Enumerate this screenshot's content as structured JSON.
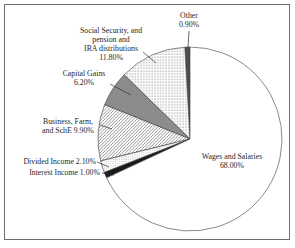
{
  "chart_data": {
    "type": "pie",
    "title": "",
    "categories": [
      "Other",
      "Social Security, and pension and IRA distributions",
      "Capital Gains",
      "Business, Farm, and SchE",
      "Divided Income",
      "Interest Income",
      "Wages and Salaries"
    ],
    "values": [
      0.9,
      11.8,
      6.2,
      9.9,
      2.1,
      1.0,
      68.0
    ],
    "unit": "percent",
    "start_angle_deg": 90,
    "direction": "counterclockwise",
    "legend_position": "labels-with-leader-lines",
    "grid": false,
    "slices": [
      {
        "name": "other",
        "category": "Other",
        "value": 0.9,
        "display": "Other\n0.90%",
        "fill": "dark-gray"
      },
      {
        "name": "social-security",
        "category": "Social Security, and pension and IRA distributions",
        "value": 11.8,
        "display": "Social Security, and\npension and\nIRA distributions\n11.80%",
        "fill": "dots"
      },
      {
        "name": "capital-gains",
        "category": "Capital Gains",
        "value": 6.2,
        "display": "Capital Gains\n6.20%",
        "fill": "gray"
      },
      {
        "name": "business-farm-sche",
        "category": "Business, Farm, and SchE",
        "value": 9.9,
        "display": "Business, Farm,\nand SchE 9.90%",
        "fill": "diagonal-hatch"
      },
      {
        "name": "divided-income",
        "category": "Divided Income",
        "value": 2.1,
        "display": "Divided Income 2.10%",
        "fill": "fine-dots"
      },
      {
        "name": "interest-income",
        "category": "Interest Income",
        "value": 1.0,
        "display": "Interest Income 1.00%",
        "fill": "black"
      },
      {
        "name": "wages-salaries",
        "category": "Wages and Salaries",
        "value": 68.0,
        "display": "Wages and Salaries\n68.00%",
        "fill": "white"
      }
    ]
  },
  "colors": {
    "background": "#ffffff",
    "frame_border": "#6e6e6e",
    "slice_outline": "#3c3c3c",
    "gray": "#8c8c8c",
    "dark_gray": "#4f4f4f",
    "black": "#1a1a1a",
    "white": "#ffffff",
    "pattern_dot": "#6a6a6a",
    "pattern_fine_dot": "#8a8a8a",
    "pattern_hatch_line": "#3c3c3c",
    "leader_line": "#2f2f2f",
    "text": "#1f1f1f"
  }
}
